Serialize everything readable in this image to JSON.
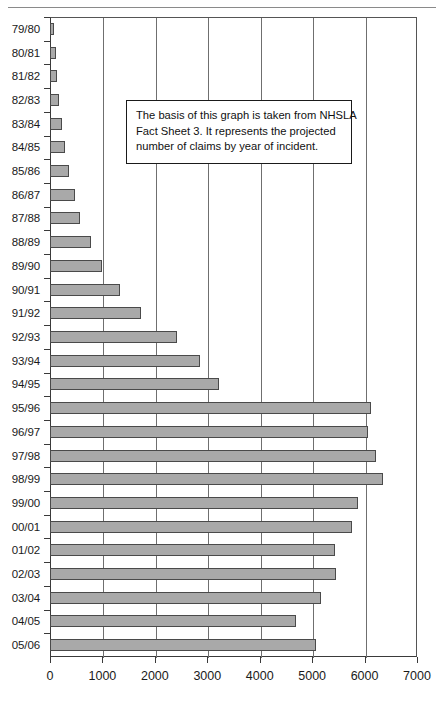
{
  "chart_data": {
    "type": "bar",
    "orientation": "horizontal",
    "title": "",
    "xlabel": "",
    "ylabel": "",
    "xlim": [
      0,
      7000
    ],
    "xticks": [
      0,
      1000,
      2000,
      3000,
      4000,
      5000,
      6000,
      7000
    ],
    "grid": "vertical",
    "legend": "none",
    "bar_color": "#a9a9a9",
    "bar_border_color": "#4a4a4a",
    "categories": [
      "79/80",
      "80/81",
      "81/82",
      "82/83",
      "83/84",
      "84/85",
      "85/86",
      "86/87",
      "87/88",
      "88/89",
      "89/90",
      "90/91",
      "91/92",
      "92/93",
      "93/94",
      "94/95",
      "95/96",
      "96/97",
      "97/98",
      "98/99",
      "99/00",
      "00/01",
      "01/02",
      "02/03",
      "03/04",
      "04/05",
      "05/06"
    ],
    "values": [
      80,
      110,
      140,
      180,
      230,
      280,
      360,
      480,
      570,
      790,
      1000,
      1330,
      1740,
      2430,
      2870,
      3220,
      6120,
      6070,
      6220,
      6360,
      5870,
      5760,
      5430,
      5450,
      5160,
      4700,
      5080
    ],
    "annotation": {
      "lines": [
        "The basis of this graph is taken from NHSLA",
        "Fact Sheet 3. It represents the projected",
        "number of claims by year of incident."
      ]
    }
  }
}
